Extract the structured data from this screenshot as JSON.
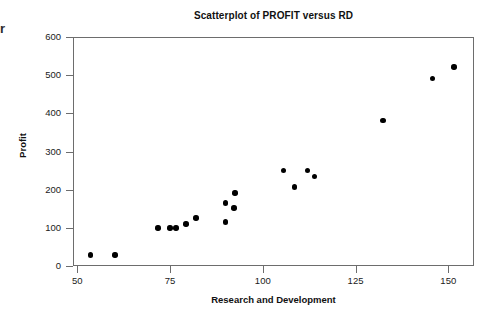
{
  "chart_data": {
    "type": "scatter",
    "title": "Scatterplot of PROFIT versus RD",
    "xlabel": "Research and Development",
    "ylabel": "Profit",
    "xlim": [
      50,
      158
    ],
    "ylim": [
      0,
      620
    ],
    "grid": false,
    "legend": null,
    "xticks": [
      "50",
      "75",
      "100",
      "125",
      "150"
    ],
    "xtick_values": [
      50,
      75,
      100,
      125,
      150
    ],
    "yticks": [
      "0",
      "100",
      "200",
      "300",
      "400",
      "500",
      "600"
    ],
    "ytick_values": [
      0,
      100,
      200,
      300,
      400,
      500,
      600
    ],
    "marker": "filled-circle",
    "marker_color": "#000000",
    "points": [
      {
        "x": 53.5,
        "y": 29
      },
      {
        "x": 60.2,
        "y": 29
      },
      {
        "x": 71.8,
        "y": 100
      },
      {
        "x": 75.0,
        "y": 100
      },
      {
        "x": 76.6,
        "y": 100
      },
      {
        "x": 79.3,
        "y": 110
      },
      {
        "x": 82.0,
        "y": 126
      },
      {
        "x": 90.0,
        "y": 115
      },
      {
        "x": 90.0,
        "y": 165
      },
      {
        "x": 92.2,
        "y": 152
      },
      {
        "x": 92.5,
        "y": 191
      },
      {
        "x": 105.5,
        "y": 251
      },
      {
        "x": 108.5,
        "y": 207
      },
      {
        "x": 112.0,
        "y": 251
      },
      {
        "x": 114.0,
        "y": 235
      },
      {
        "x": 132.4,
        "y": 382
      },
      {
        "x": 145.8,
        "y": 492
      },
      {
        "x": 151.5,
        "y": 521
      }
    ]
  },
  "artifacts": {
    "edge_glyph": "r"
  }
}
